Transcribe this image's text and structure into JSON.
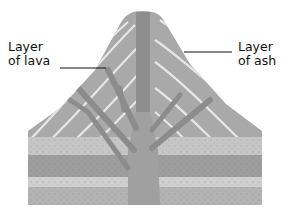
{
  "diagram": {
    "type": "volcano-cross-section",
    "labels": {
      "lava": {
        "line1": "Layer",
        "line2": "of lava"
      },
      "ash": {
        "line1": "Layer",
        "line2": "of ash"
      }
    },
    "colors": {
      "background": "#ffffff",
      "cone_fill": "#a9a9a9",
      "ash_bands": "#e6e6e6",
      "vent": "#8e8e8e",
      "rock_light": "#c8c8c8",
      "rock_dark": "#9c9c9c",
      "label_text": "#111111"
    }
  }
}
